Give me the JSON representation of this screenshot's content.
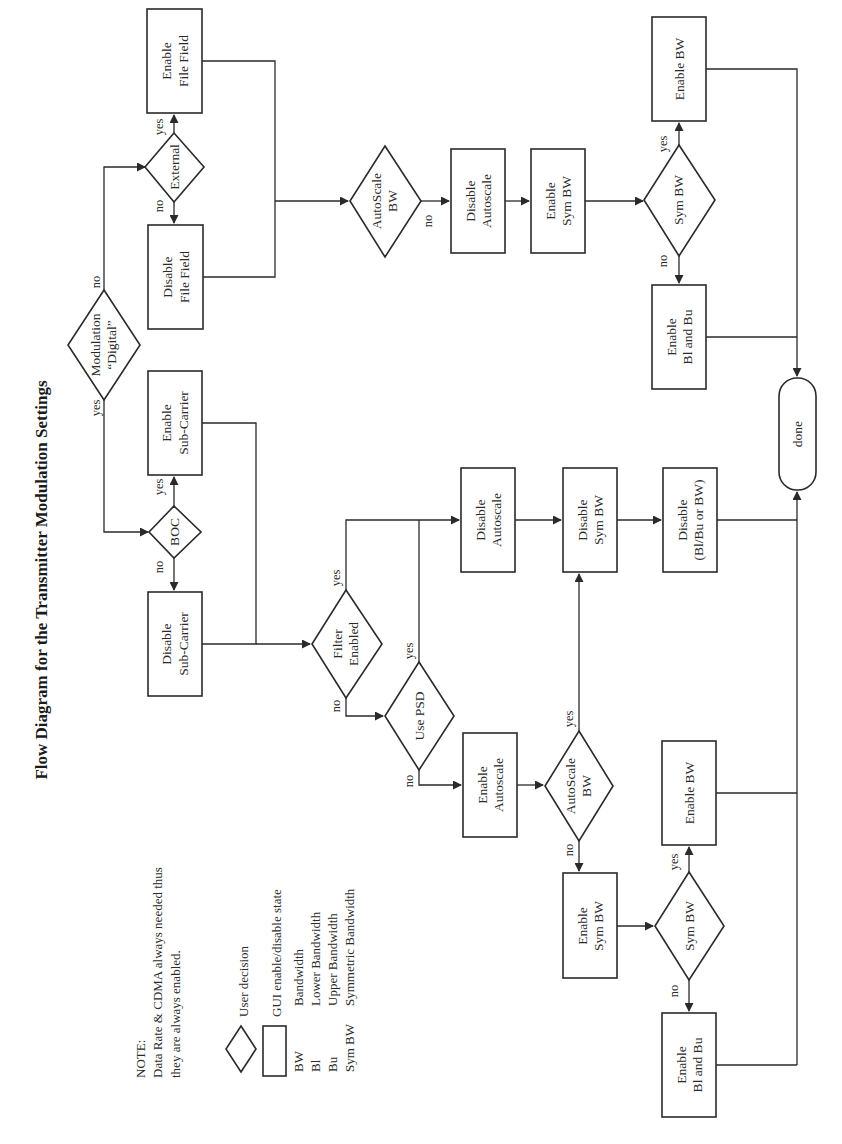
{
  "title": "Flow Diagram for the Transmitter Modulation Settings",
  "colors": {
    "ink": "#2a2a2a",
    "background": "#ffffff"
  },
  "orientation": "rotated 90deg counter-clockwise (flow runs top-to-bottom on page, text reads bottom-to-top)",
  "note": {
    "heading": "NOTE:",
    "line1": "Data Rate & CDMA always needed thus",
    "line2": "they are always enabled."
  },
  "legend": {
    "decision": "User decision",
    "state": "GUI enable/disable state",
    "abbreviations": [
      {
        "abbr": "BW",
        "meaning": "Bandwidth"
      },
      {
        "abbr": "Bl",
        "meaning": "Lower Bandwidth"
      },
      {
        "abbr": "Bu",
        "meaning": "Upper Bandwidth"
      },
      {
        "abbr": "Sym BW",
        "meaning": "Symmetric Bandwidth"
      }
    ]
  },
  "edge_labels": {
    "yes": "yes",
    "no": "no"
  },
  "nodes": {
    "modulation": {
      "type": "decision",
      "line1": "Modulation",
      "line2": "“Digital”"
    },
    "external": {
      "type": "decision",
      "line1": "External"
    },
    "enable_file_field": {
      "type": "state",
      "line1": "Enable",
      "line2": "File Field"
    },
    "disable_file_field": {
      "type": "state",
      "line1": "Disable",
      "line2": "File Field"
    },
    "autoscale_bw_digital": {
      "type": "decision",
      "line1": "AutoScale",
      "line2": "BW"
    },
    "disable_autoscale_digital": {
      "type": "state",
      "line1": "Disable",
      "line2": "Autoscale"
    },
    "enable_sym_bw_digital": {
      "type": "state",
      "line1": "Enable",
      "line2": "Sym BW"
    },
    "sym_bw_digital": {
      "type": "decision",
      "line1": "Sym BW"
    },
    "enable_bw_digital": {
      "type": "state",
      "line1": "Enable BW"
    },
    "enable_bl_bu_digital": {
      "type": "state",
      "line1": "Enable",
      "line2": "Bl and Bu"
    },
    "done": {
      "type": "terminator",
      "line1": "done"
    },
    "boc": {
      "type": "decision",
      "line1": "BOC"
    },
    "enable_subcarrier": {
      "type": "state",
      "line1": "Enable",
      "line2": "Sub-Carrier"
    },
    "disable_subcarrier": {
      "type": "state",
      "line1": "Disable",
      "line2": "Sub-Carrier"
    },
    "filter_enabled": {
      "type": "decision",
      "line1": "Filter",
      "line2": "Enabled"
    },
    "use_psd": {
      "type": "decision",
      "line1": "Use PSD"
    },
    "disable_autoscale": {
      "type": "state",
      "line1": "Disable",
      "line2": "Autoscale"
    },
    "disable_sym_bw": {
      "type": "state",
      "line1": "Disable",
      "line2": "Sym BW"
    },
    "disable_bl_bu_bw": {
      "type": "state",
      "line1": "Disable",
      "line2": "(Bl/Bu or BW)"
    },
    "enable_autoscale": {
      "type": "state",
      "line1": "Enable",
      "line2": "Autoscale"
    },
    "autoscale_bw": {
      "type": "decision",
      "line1": "AutoScale",
      "line2": "BW"
    },
    "enable_sym_bw": {
      "type": "state",
      "line1": "Enable",
      "line2": "Sym BW"
    },
    "sym_bw": {
      "type": "decision",
      "line1": "Sym BW"
    },
    "enable_bw": {
      "type": "state",
      "line1": "Enable BW"
    },
    "enable_bl_bu": {
      "type": "state",
      "line1": "Enable",
      "line2": "Bl and Bu"
    }
  },
  "edges": [
    {
      "from": "modulation",
      "to": "external",
      "label": "no"
    },
    {
      "from": "modulation",
      "to": "boc",
      "label": "yes"
    },
    {
      "from": "external",
      "to": "enable_file_field",
      "label": "yes"
    },
    {
      "from": "external",
      "to": "disable_file_field",
      "label": "no"
    },
    {
      "from": "enable_file_field",
      "to": "autoscale_bw_digital"
    },
    {
      "from": "disable_file_field",
      "to": "autoscale_bw_digital"
    },
    {
      "from": "autoscale_bw_digital",
      "to": "disable_autoscale_digital",
      "label": "no"
    },
    {
      "from": "disable_autoscale_digital",
      "to": "enable_sym_bw_digital"
    },
    {
      "from": "enable_sym_bw_digital",
      "to": "sym_bw_digital"
    },
    {
      "from": "sym_bw_digital",
      "to": "enable_bw_digital",
      "label": "yes"
    },
    {
      "from": "sym_bw_digital",
      "to": "enable_bl_bu_digital",
      "label": "no"
    },
    {
      "from": "enable_bw_digital",
      "to": "done"
    },
    {
      "from": "enable_bl_bu_digital",
      "to": "done"
    },
    {
      "from": "boc",
      "to": "enable_subcarrier",
      "label": "yes"
    },
    {
      "from": "boc",
      "to": "disable_subcarrier",
      "label": "no"
    },
    {
      "from": "enable_subcarrier",
      "to": "filter_enabled"
    },
    {
      "from": "disable_subcarrier",
      "to": "filter_enabled"
    },
    {
      "from": "filter_enabled",
      "to": "disable_autoscale",
      "label": "yes"
    },
    {
      "from": "filter_enabled",
      "to": "use_psd",
      "label": "no"
    },
    {
      "from": "use_psd",
      "to": "disable_autoscale",
      "label": "yes"
    },
    {
      "from": "use_psd",
      "to": "enable_autoscale",
      "label": "no"
    },
    {
      "from": "disable_autoscale",
      "to": "disable_sym_bw"
    },
    {
      "from": "disable_sym_bw",
      "to": "disable_bl_bu_bw"
    },
    {
      "from": "disable_bl_bu_bw",
      "to": "done"
    },
    {
      "from": "enable_autoscale",
      "to": "autoscale_bw"
    },
    {
      "from": "autoscale_bw",
      "to": "disable_sym_bw",
      "label": "yes"
    },
    {
      "from": "autoscale_bw",
      "to": "enable_sym_bw",
      "label": "no"
    },
    {
      "from": "enable_sym_bw",
      "to": "sym_bw"
    },
    {
      "from": "sym_bw",
      "to": "enable_bw",
      "label": "yes"
    },
    {
      "from": "sym_bw",
      "to": "enable_bl_bu",
      "label": "no"
    },
    {
      "from": "enable_bw",
      "to": "done"
    },
    {
      "from": "enable_bl_bu",
      "to": "done"
    }
  ]
}
